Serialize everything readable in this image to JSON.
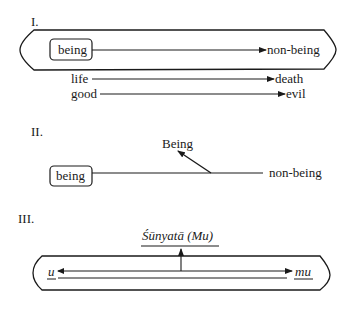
{
  "diagram": {
    "colors": {
      "ink": "#1a1a1a",
      "background": "#ffffff"
    },
    "sections": [
      {
        "label": "I.",
        "boxed_term": "being",
        "arrow_target": "non-being",
        "pairs": [
          {
            "from": "life",
            "to": "death"
          },
          {
            "from": "good",
            "to": "evil"
          }
        ]
      },
      {
        "label": "II.",
        "boxed_term": "being",
        "line_end": "non-being",
        "raised_term": "Being"
      },
      {
        "label": "III.",
        "top_term": "Śūnyatā (Mu)",
        "left_term": "u",
        "right_term": "mu"
      }
    ]
  }
}
